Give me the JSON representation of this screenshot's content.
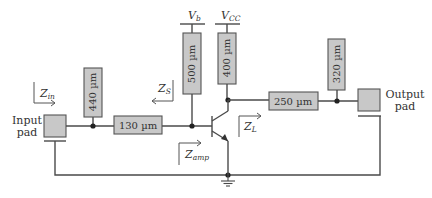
{
  "diagram": {
    "input_pad": {
      "label_line1": "Input",
      "label_line2": "pad"
    },
    "output_pad": {
      "label_line1": "Output",
      "label_line2": "pad"
    },
    "lines": {
      "stub_in": "440 µm",
      "series_in": "130 µm",
      "bias_base": "500 µm",
      "bias_collector": "400 µm",
      "series_out": "250 µm",
      "stub_out": "320 µm"
    },
    "supplies": {
      "base": {
        "main": "V",
        "sub": "b"
      },
      "collector": {
        "main": "V",
        "sub": "CC"
      }
    },
    "impedances": {
      "zin": {
        "main": "Z",
        "sub": "in"
      },
      "zs": {
        "main": "Z",
        "sub": "S"
      },
      "zamp": {
        "main": "Z",
        "sub": "amp"
      },
      "zl": {
        "main": "Z",
        "sub": "L"
      }
    },
    "colors": {
      "box_fill": "#c8c8c8",
      "wire": "#4a4a4a"
    }
  }
}
